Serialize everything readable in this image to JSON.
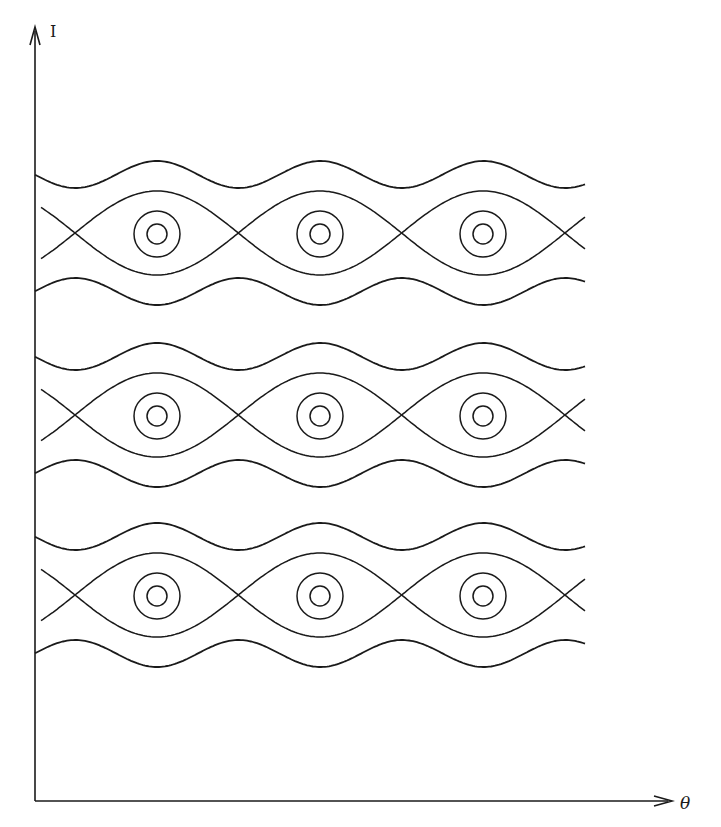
{
  "chart_data": {
    "type": "phase-portrait",
    "title": "",
    "xlabel": "θ",
    "ylabel": "I",
    "stroke_color": "#1a1a1a",
    "background": "#ffffff",
    "axes": {
      "origin": [
        35,
        801
      ],
      "y_top": 27,
      "x_right": 672
    },
    "period_px": 163.3,
    "x_points": [
      75,
      238,
      401,
      565
    ],
    "o_points": [
      157,
      320,
      483
    ],
    "curve_x_range": [
      35,
      585
    ],
    "separatrix_x_range": [
      41,
      585
    ],
    "resonances": [
      {
        "center_y": 233,
        "label": "resonance-1"
      },
      {
        "center_y": 415,
        "label": "resonance-2"
      },
      {
        "center_y": 595,
        "label": "resonance-3"
      }
    ],
    "separatrix_half_width": 42,
    "outer_wave": {
      "offset": 58.5,
      "amplitude": 13.5
    },
    "island_circles": {
      "outer_radius": 23,
      "inner_radius": 10
    }
  }
}
